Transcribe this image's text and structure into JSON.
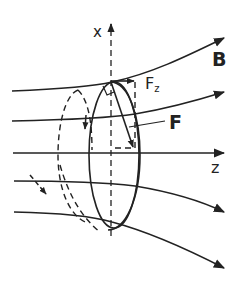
{
  "figure": {
    "labels": {
      "x_axis": "x",
      "z_axis": "z",
      "field": "B",
      "force": "F",
      "force_component_main": "F",
      "force_component_sub": "z"
    },
    "colors": {
      "ink": "#222222",
      "background": "#ffffff"
    }
  }
}
